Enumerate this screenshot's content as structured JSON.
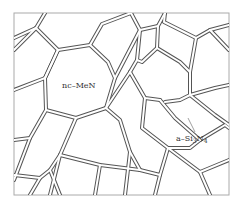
{
  "diagram": {
    "type": "nanocomposite-grain-structure",
    "labels": {
      "grain": "nc–MeN",
      "boundary_prefix": "a–Si",
      "boundary_sub1": "3",
      "boundary_mid": "N",
      "boundary_sub2": "4"
    },
    "colors": {
      "line": "#555555",
      "background": "#ffffff",
      "frame": "#999999"
    }
  }
}
